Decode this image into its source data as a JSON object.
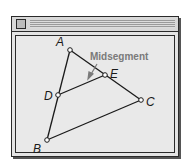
{
  "window": {
    "title": "",
    "close_box": "close-box"
  },
  "diagram": {
    "annotation": "Midsegment",
    "annotation_color": "#7a7a7a",
    "points": [
      {
        "label": "A",
        "x": 70,
        "y": 50
      },
      {
        "label": "B",
        "x": 47,
        "y": 140
      },
      {
        "label": "C",
        "x": 141,
        "y": 100
      },
      {
        "label": "D",
        "x": 58,
        "y": 95
      },
      {
        "label": "E",
        "x": 105,
        "y": 75
      }
    ],
    "segments": [
      [
        "A",
        "B"
      ],
      [
        "A",
        "C"
      ],
      [
        "B",
        "C"
      ],
      [
        "D",
        "E"
      ]
    ]
  }
}
